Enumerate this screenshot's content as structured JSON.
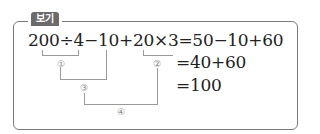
{
  "badge": {
    "label": "보기"
  },
  "expression": {
    "line1": "200÷4−10+20×3=50−10+60",
    "line2": "=40+60",
    "line3": "=100"
  },
  "steps": [
    "①",
    "②",
    "③",
    "④"
  ]
}
